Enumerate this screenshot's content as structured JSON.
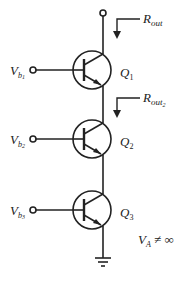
{
  "diagram": {
    "type": "cascode transistor stack",
    "labels": {
      "rout_top": {
        "main": "R",
        "sub": "out"
      },
      "rout_mid": {
        "main": "R",
        "sub": "out",
        "subsub": "2"
      },
      "vb1": {
        "main": "V",
        "sub": "b",
        "subsub": "1"
      },
      "vb2": {
        "main": "V",
        "sub": "b",
        "subsub": "2"
      },
      "vb3": {
        "main": "V",
        "sub": "b",
        "subsub": "3"
      },
      "q1": {
        "main": "Q",
        "sub": "1"
      },
      "q2": {
        "main": "Q",
        "sub": "2"
      },
      "q3": {
        "main": "Q",
        "sub": "3"
      },
      "condition": "V",
      "condition_sub": "A",
      "condition_rest": " ≠ ∞"
    },
    "colors": {
      "stroke": "#222222",
      "background": "#ffffff"
    }
  }
}
